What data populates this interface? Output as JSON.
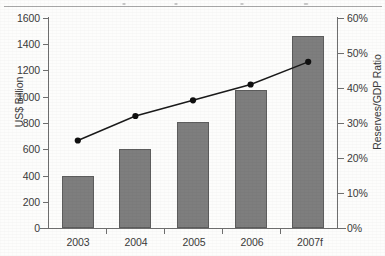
{
  "chart_data": {
    "type": "bar",
    "title": "",
    "categories": [
      "2003",
      "2004",
      "2005",
      "2006",
      "2007f"
    ],
    "series": [
      {
        "name": "Reserves",
        "type": "bar",
        "axis": "left",
        "unit": "US$ Billion",
        "values": [
          400,
          600,
          810,
          1050,
          1460
        ]
      },
      {
        "name": "Reserves/GDP Ratio",
        "type": "line",
        "axis": "right",
        "unit": "%",
        "values": [
          25,
          32,
          36.5,
          41,
          47.5
        ]
      }
    ],
    "xlabel": "",
    "ylabel": "US$ Billion",
    "ylabel_right": "Reserves/GDP Ratio",
    "ylim": [
      0,
      1600
    ],
    "ylim_right": [
      0,
      60
    ],
    "yticks": [
      "0",
      "200",
      "400",
      "600",
      "800",
      "1000",
      "1200",
      "1400",
      "1600"
    ],
    "yticks_right": [
      "0%",
      "10%",
      "20%",
      "30%",
      "40%",
      "50%",
      "60%"
    ],
    "grid": false,
    "legend": "none",
    "colors": {
      "bar_fill": "#7e7e7e",
      "bar_edge": "#5d5d5d",
      "line": "#1a1a1a",
      "marker": "#101010",
      "axis": "#6f6f6f",
      "text": "#3a3a3a",
      "background": "#fdfdfc"
    }
  },
  "axes": {
    "left": {
      "label": "US$ Billion",
      "ticks": [
        {
          "label": "1600",
          "value": 1600
        },
        {
          "label": "1400",
          "value": 1400
        },
        {
          "label": "1200",
          "value": 1200
        },
        {
          "label": "1000",
          "value": 1000
        },
        {
          "label": "800",
          "value": 800
        },
        {
          "label": "600",
          "value": 600
        },
        {
          "label": "400",
          "value": 400
        },
        {
          "label": "200",
          "value": 200
        },
        {
          "label": "0",
          "value": 0
        }
      ]
    },
    "right": {
      "label": "Reserves/GDP Ratio",
      "ticks": [
        {
          "label": "60%",
          "value": 60
        },
        {
          "label": "50%",
          "value": 50
        },
        {
          "label": "40%",
          "value": 40
        },
        {
          "label": "30%",
          "value": 30
        },
        {
          "label": "20%",
          "value": 20
        },
        {
          "label": "10%",
          "value": 10
        },
        {
          "label": "0%",
          "value": 0
        }
      ]
    },
    "bottom": {
      "ticks": [
        {
          "label": "2003"
        },
        {
          "label": "2004"
        },
        {
          "label": "2005"
        },
        {
          "label": "2006"
        },
        {
          "label": "2007f"
        }
      ]
    }
  }
}
